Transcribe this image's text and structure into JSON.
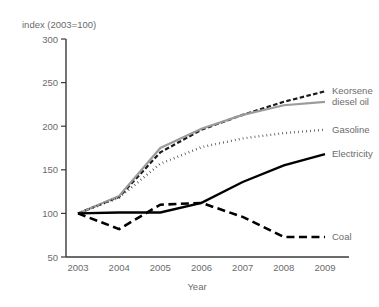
{
  "chart_data": {
    "type": "line",
    "title": "",
    "unit_label": "index (2003=100)",
    "xlabel": "Year",
    "ylabel": "",
    "categories": [
      "2003",
      "2004",
      "2005",
      "2006",
      "2007",
      "2008",
      "2009"
    ],
    "x": [
      2003,
      2004,
      2005,
      2006,
      2007,
      2008,
      2009
    ],
    "xlim": [
      2003,
      2009
    ],
    "ylim": [
      50,
      300
    ],
    "yticks": [
      50,
      100,
      150,
      200,
      250,
      300
    ],
    "grid": false,
    "legend_position": "right-of-plot",
    "series": [
      {
        "name": "Kerosene diesel oil",
        "label_line1": "Keorsene",
        "label_line2": "diesel oil",
        "style": "dotted-dashed",
        "color": "#1a1a1a",
        "values": [
          100,
          119,
          170,
          196,
          213,
          228,
          240
        ]
      },
      {
        "name": "diesel oil",
        "label_line1": "",
        "label_line2": "",
        "style": "solid-gray",
        "color": "#9b9b9b",
        "values": [
          100,
          120,
          175,
          197,
          213,
          224,
          228
        ]
      },
      {
        "name": "Gasoline",
        "label_line1": "Gasoline",
        "label_line2": "",
        "style": "dotted",
        "color": "#1a1a1a",
        "values": [
          100,
          118,
          157,
          176,
          186,
          192,
          196
        ]
      },
      {
        "name": "Electricity",
        "label_line1": "Electricity",
        "label_line2": "",
        "style": "solid-black",
        "color": "#000000",
        "values": [
          100,
          101,
          101,
          112,
          136,
          155,
          168
        ]
      },
      {
        "name": "Coal",
        "label_line1": "Coal",
        "label_line2": "",
        "style": "dashed",
        "color": "#000000",
        "values": [
          100,
          82,
          110,
          112,
          96,
          73,
          73
        ]
      }
    ]
  }
}
